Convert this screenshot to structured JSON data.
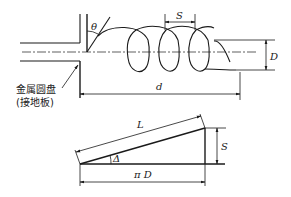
{
  "helix_diagram": {
    "labels": {
      "theta": "θ",
      "pitch": "S",
      "diameter": "D",
      "length": "d",
      "disk_label_line1": "金属圆盘",
      "disk_label_line2": "(接地板)"
    }
  },
  "unrolled_triangle": {
    "labels": {
      "hypotenuse": "L",
      "angle": "Δ",
      "height": "S",
      "base": "π D"
    }
  }
}
